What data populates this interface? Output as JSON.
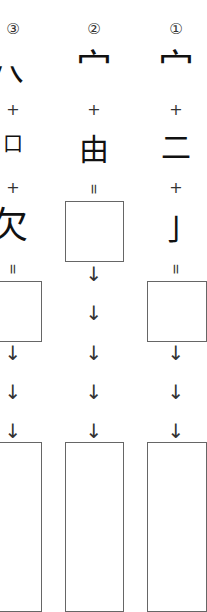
{
  "columns": [
    {
      "id": "col3",
      "center_x": 13,
      "label": "③",
      "top_radical": "穴",
      "plus1": "+",
      "middle_component": "口",
      "plus2": "+",
      "bottom_component": "欠",
      "equals": "=",
      "arrows": [
        "↓",
        "↓",
        "↓"
      ]
    },
    {
      "id": "col2",
      "center_x": 94,
      "label": "②",
      "top_radical": "宀",
      "plus1": "+",
      "middle_component": "由",
      "equals": "=",
      "arrows": [
        "↓",
        "↓",
        "↓",
        "↓",
        "↓"
      ]
    },
    {
      "id": "col1",
      "center_x": 176,
      "label": "①",
      "top_radical": "宀",
      "plus1": "+",
      "middle_component": "二",
      "plus2": "+",
      "bottom_component": "亅",
      "equals": "=",
      "arrows": [
        "↓",
        "↓",
        "↓"
      ]
    }
  ],
  "colors": {
    "background": "#ffffff",
    "box_border": "#666666",
    "glyph": "#111111"
  }
}
